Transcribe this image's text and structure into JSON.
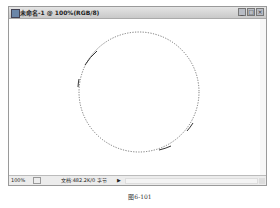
{
  "window": {
    "title": "未命名-1 @ 100%(RGB/8)",
    "buttons": {
      "minimize": "_",
      "maximize": "□",
      "close": "×"
    }
  },
  "canvas": {
    "selection": {
      "shape": "circle",
      "style": "marching-ants",
      "cx": 130,
      "cy": 73,
      "r": 60
    }
  },
  "statusbar": {
    "zoom": "100%",
    "doc_info": "文档:482.2K/0 字节",
    "arrow": "▶"
  },
  "caption": "图6-101"
}
